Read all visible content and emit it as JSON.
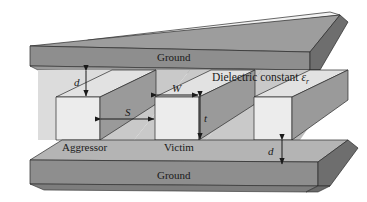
{
  "figure": {
    "type": "3d-technical-diagram",
    "background_color": "#ffffff",
    "line_color": "#1a1a1a"
  },
  "planes": {
    "top": {
      "label": "Ground",
      "name": "top-ground-plane",
      "top_face_color": "#9d9d9d",
      "front_face_color": "#8e8e8e",
      "right_face_color": "#6e6e6e",
      "cap_color": "#f2f2f2"
    },
    "bottom": {
      "label": "Ground",
      "name": "bottom-ground-plane",
      "top_face_color": "#b4b4b4",
      "front_face_color": "#8e8e8e",
      "right_face_color": "#6e6e6e"
    }
  },
  "conductors": [
    {
      "label": "Aggressor",
      "name": "conductor-aggressor",
      "front_face_color": "#ececec",
      "top_face_color": "#e2e2e2",
      "side_face_color": "#9a9a9a"
    },
    {
      "label": "Victim",
      "name": "conductor-victim",
      "front_face_color": "#ececec",
      "top_face_color": "#e2e2e2",
      "side_face_color": "#9a9a9a"
    },
    {
      "label": "",
      "name": "conductor-third",
      "front_face_color": "#ececec",
      "top_face_color": "#e2e2e2",
      "side_face_color": "#9a9a9a"
    }
  ],
  "dimensions": [
    {
      "symbol": "d",
      "name": "dimension-d-top",
      "orientation": "vertical",
      "meaning": "separation between top ground plane and conductor top"
    },
    {
      "symbol": "S",
      "name": "dimension-s",
      "orientation": "horizontal",
      "meaning": "edge-to-edge spacing between aggressor and victim"
    },
    {
      "symbol": "W",
      "name": "dimension-w",
      "orientation": "horizontal",
      "meaning": "conductor width"
    },
    {
      "symbol": "t",
      "name": "dimension-t",
      "orientation": "vertical",
      "meaning": "conductor thickness"
    },
    {
      "symbol": "d",
      "name": "dimension-d-bottom",
      "orientation": "vertical",
      "meaning": "separation between conductor bottom and bottom ground plane"
    }
  ],
  "annotations": {
    "dielectric_text": "Dielectric constant",
    "dielectric_symbol": "ε",
    "dielectric_subscript": "r"
  }
}
